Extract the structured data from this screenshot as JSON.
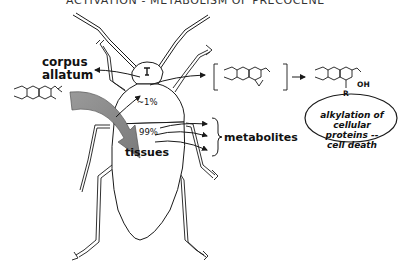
{
  "title": "ACTIVATION - METABOLISM OF PRECOCENE",
  "labels": {
    "corpus_line1": "corpus",
    "corpus_line2": "allatum",
    "pct_small": "~1%",
    "pct_large": "99%",
    "tissues": "tissues",
    "metabolites": "metabolites"
  },
  "chemistry": {
    "precursor": "precocene (chromene)",
    "intermediate": "epoxide",
    "product_group": "OH",
    "product_substituent": "R",
    "methoxy": "O",
    "ring_oxygen": "O"
  },
  "outcome": {
    "line1": "alkylation of",
    "line2": "cellular proteins --",
    "line3": "cell death"
  },
  "colors": {
    "ink": "#1a1a1a",
    "arrow_fill": "#8c8c8c",
    "background": "#ffffff"
  }
}
